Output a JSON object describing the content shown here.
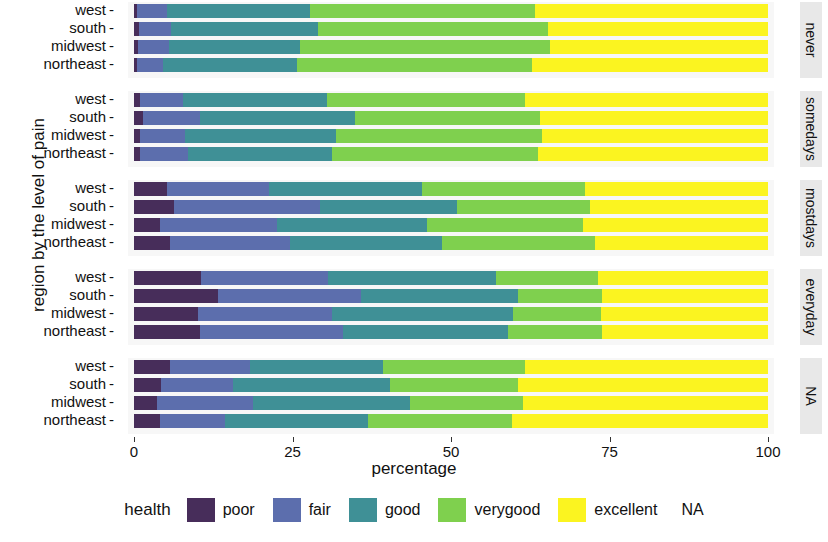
{
  "axes": {
    "y_title": "region by the level of pain",
    "x_title": "percentage",
    "x_ticks": [
      "0",
      "25",
      "50",
      "75",
      "100"
    ]
  },
  "legend": {
    "title": "health",
    "items": [
      {
        "label": "poor",
        "color": "#472d5a"
      },
      {
        "label": "fair",
        "color": "#5c6ead"
      },
      {
        "label": "good",
        "color": "#3f9096"
      },
      {
        "label": "verygood",
        "color": "#7fd04e"
      },
      {
        "label": "excellent",
        "color": "#fbf420"
      }
    ],
    "na_label": "NA"
  },
  "chart_data": {
    "type": "bar",
    "orientation": "horizontal",
    "stacked": true,
    "stack_total": 100,
    "title": "",
    "xlabel": "percentage",
    "ylabel": "region by the level of pain",
    "xlim": [
      0,
      100
    ],
    "grid": false,
    "legend_title": "health",
    "legend_position": "bottom",
    "series_names": [
      "poor",
      "fair",
      "good",
      "verygood",
      "excellent"
    ],
    "series_colors": [
      "#472d5a",
      "#5c6ead",
      "#3f9096",
      "#7fd04e",
      "#fbf420"
    ],
    "facet_variable": "level of pain",
    "facets": [
      {
        "label": "never",
        "categories": [
          "west",
          "south",
          "midwest",
          "northeast"
        ],
        "rows": [
          {
            "category": "west",
            "values": [
              0.5,
              4.7,
              22.6,
              35.4,
              36.8
            ]
          },
          {
            "category": "south",
            "values": [
              0.8,
              5.0,
              23.2,
              36.3,
              34.7
            ]
          },
          {
            "category": "midwest",
            "values": [
              0.7,
              4.8,
              20.7,
              39.4,
              34.4
            ]
          },
          {
            "category": "northeast",
            "values": [
              0.5,
              4.1,
              21.1,
              37.1,
              37.2
            ]
          }
        ]
      },
      {
        "label": "somedays",
        "categories": [
          "west",
          "south",
          "midwest",
          "northeast"
        ],
        "rows": [
          {
            "category": "west",
            "values": [
              0.9,
              6.8,
              22.7,
              31.3,
              38.3
            ]
          },
          {
            "category": "south",
            "values": [
              1.4,
              9.0,
              24.5,
              29.1,
              36.0
            ]
          },
          {
            "category": "midwest",
            "values": [
              0.9,
              7.1,
              23.9,
              32.5,
              35.6
            ]
          },
          {
            "category": "northeast",
            "values": [
              0.9,
              7.6,
              22.8,
              32.5,
              36.2
            ]
          }
        ]
      },
      {
        "label": "mostdays",
        "categories": [
          "west",
          "south",
          "midwest",
          "northeast"
        ],
        "rows": [
          {
            "category": "west",
            "values": [
              5.2,
              16.1,
              24.1,
              25.7,
              28.9
            ]
          },
          {
            "category": "south",
            "values": [
              6.3,
              23.0,
              21.6,
              21.0,
              28.1
            ]
          },
          {
            "category": "midwest",
            "values": [
              4.1,
              18.5,
              23.6,
              24.6,
              29.2
            ]
          },
          {
            "category": "northeast",
            "values": [
              5.7,
              18.9,
              24.0,
              24.1,
              27.3
            ]
          }
        ]
      },
      {
        "label": "everyday",
        "categories": [
          "west",
          "south",
          "midwest",
          "northeast"
        ],
        "rows": [
          {
            "category": "west",
            "values": [
              10.6,
              20.0,
              26.5,
              16.1,
              26.8
            ]
          },
          {
            "category": "south",
            "values": [
              13.2,
              22.6,
              24.8,
              13.2,
              26.2
            ]
          },
          {
            "category": "midwest",
            "values": [
              10.1,
              21.1,
              28.6,
              13.9,
              26.3
            ]
          },
          {
            "category": "northeast",
            "values": [
              10.4,
              22.6,
              26.0,
              14.8,
              26.2
            ]
          }
        ]
      },
      {
        "label": "NA",
        "categories": [
          "west",
          "south",
          "midwest",
          "northeast"
        ],
        "rows": [
          {
            "category": "west",
            "values": [
              5.7,
              12.6,
              21.0,
              22.4,
              38.3
            ]
          },
          {
            "category": "south",
            "values": [
              4.3,
              11.3,
              24.8,
              20.2,
              39.4
            ]
          },
          {
            "category": "midwest",
            "values": [
              3.6,
              15.2,
              24.7,
              17.9,
              38.6
            ]
          },
          {
            "category": "northeast",
            "values": [
              4.1,
              10.3,
              22.5,
              22.7,
              40.4
            ]
          }
        ]
      }
    ]
  }
}
